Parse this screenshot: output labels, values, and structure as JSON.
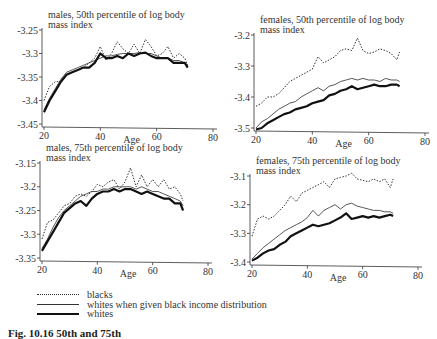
{
  "legend": [
    {
      "label": "blacks",
      "style": "dotted"
    },
    {
      "label": "whites when given black income distribution",
      "style": "thin"
    },
    {
      "label": "whites",
      "style": "thick"
    }
  ],
  "caption": "Fig. 10.16   50th and 75th",
  "chart_data": [
    {
      "type": "line",
      "title": "males, 50th percentile of log body mass index",
      "xlabel": "Age",
      "ylabel": "",
      "xlim": [
        20,
        80
      ],
      "ylim": [
        -3.45,
        -3.25
      ],
      "xticks": [
        20,
        40,
        60,
        80
      ],
      "yticks": [
        -3.25,
        -3.3,
        -3.35,
        -3.4,
        -3.45
      ],
      "ytick_labels": [
        "-3.25",
        "-3.3",
        "-3.35",
        "-3.4",
        "-3.45"
      ],
      "x": [
        20,
        22,
        24,
        26,
        28,
        30,
        32,
        34,
        36,
        38,
        40,
        42,
        44,
        46,
        48,
        50,
        52,
        54,
        56,
        58,
        60,
        62,
        64,
        66,
        68,
        70,
        71
      ],
      "series": [
        {
          "name": "blacks",
          "values": [
            -3.4,
            -3.37,
            -3.36,
            -3.36,
            -3.345,
            -3.34,
            -3.335,
            -3.33,
            -3.32,
            -3.31,
            -3.285,
            -3.315,
            -3.3,
            -3.275,
            -3.29,
            -3.3,
            -3.28,
            -3.3,
            -3.27,
            -3.285,
            -3.305,
            -3.3,
            -3.285,
            -3.31,
            -3.3,
            -3.31,
            -3.325
          ]
        },
        {
          "name": "whites when given black income distribution",
          "values": [
            -3.42,
            -3.395,
            -3.375,
            -3.355,
            -3.34,
            -3.335,
            -3.33,
            -3.325,
            -3.32,
            -3.315,
            -3.31,
            -3.305,
            -3.305,
            -3.302,
            -3.3,
            -3.3,
            -3.3,
            -3.298,
            -3.3,
            -3.3,
            -3.305,
            -3.31,
            -3.31,
            -3.315,
            -3.315,
            -3.32,
            -3.325
          ]
        },
        {
          "name": "whites",
          "values": [
            -3.425,
            -3.4,
            -3.38,
            -3.36,
            -3.345,
            -3.34,
            -3.335,
            -3.33,
            -3.33,
            -3.32,
            -3.3,
            -3.31,
            -3.31,
            -3.305,
            -3.31,
            -3.3,
            -3.305,
            -3.3,
            -3.298,
            -3.305,
            -3.31,
            -3.31,
            -3.31,
            -3.32,
            -3.32,
            -3.32,
            -3.33
          ]
        }
      ]
    },
    {
      "type": "line",
      "title": "females, 50th percentile of log body mass index",
      "xlabel": "Age",
      "ylabel": "",
      "xlim": [
        20,
        80
      ],
      "ylim": [
        -3.5,
        -3.2
      ],
      "xticks": [
        20,
        40,
        60,
        80
      ],
      "yticks": [
        -3.2,
        -3.3,
        -3.4,
        -3.5
      ],
      "ytick_labels": [
        "-3.2",
        "-3.3",
        "-3.4",
        "-3.5"
      ],
      "x": [
        20,
        22,
        24,
        26,
        28,
        30,
        32,
        34,
        36,
        38,
        40,
        42,
        44,
        46,
        48,
        50,
        52,
        54,
        56,
        58,
        60,
        62,
        64,
        66,
        68,
        70,
        71
      ],
      "series": [
        {
          "name": "blacks",
          "values": [
            -3.43,
            -3.42,
            -3.4,
            -3.4,
            -3.39,
            -3.37,
            -3.35,
            -3.34,
            -3.33,
            -3.32,
            -3.31,
            -3.27,
            -3.29,
            -3.28,
            -3.27,
            -3.25,
            -3.245,
            -3.25,
            -3.21,
            -3.25,
            -3.26,
            -3.255,
            -3.245,
            -3.25,
            -3.26,
            -3.28,
            -3.255
          ]
        },
        {
          "name": "whites when given black income distribution",
          "values": [
            -3.5,
            -3.48,
            -3.47,
            -3.455,
            -3.44,
            -3.43,
            -3.42,
            -3.415,
            -3.4,
            -3.39,
            -3.38,
            -3.37,
            -3.38,
            -3.365,
            -3.36,
            -3.35,
            -3.345,
            -3.34,
            -3.345,
            -3.34,
            -3.345,
            -3.345,
            -3.35,
            -3.34,
            -3.345,
            -3.345,
            -3.35
          ]
        },
        {
          "name": "whites",
          "values": [
            -3.505,
            -3.5,
            -3.485,
            -3.475,
            -3.465,
            -3.455,
            -3.45,
            -3.44,
            -3.435,
            -3.43,
            -3.42,
            -3.415,
            -3.41,
            -3.395,
            -3.39,
            -3.38,
            -3.375,
            -3.365,
            -3.375,
            -3.37,
            -3.365,
            -3.36,
            -3.365,
            -3.365,
            -3.36,
            -3.36,
            -3.365
          ]
        }
      ]
    },
    {
      "type": "line",
      "title": "males, 75th percentile of log body mass index",
      "xlabel": "Age",
      "ylabel": "",
      "xlim": [
        20,
        80
      ],
      "ylim": [
        -3.35,
        -3.15
      ],
      "xticks": [
        20,
        40,
        60,
        80
      ],
      "yticks": [
        -3.15,
        -3.2,
        -3.25,
        -3.3,
        -3.35
      ],
      "ytick_labels": [
        "-3.15",
        "-3.2",
        "-3.25",
        "-3.3",
        "-3.35"
      ],
      "x": [
        20,
        22,
        24,
        26,
        28,
        30,
        32,
        34,
        36,
        38,
        40,
        42,
        44,
        46,
        48,
        50,
        52,
        54,
        56,
        58,
        60,
        62,
        64,
        66,
        68,
        70,
        71
      ],
      "series": [
        {
          "name": "blacks",
          "values": [
            -3.31,
            -3.275,
            -3.27,
            -3.255,
            -3.24,
            -3.235,
            -3.22,
            -3.215,
            -3.22,
            -3.21,
            -3.195,
            -3.2,
            -3.19,
            -3.185,
            -3.205,
            -3.19,
            -3.16,
            -3.2,
            -3.175,
            -3.2,
            -3.185,
            -3.2,
            -3.185,
            -3.205,
            -3.2,
            -3.215,
            -3.23
          ]
        },
        {
          "name": "whites when given black income distribution",
          "values": [
            -3.33,
            -3.31,
            -3.285,
            -3.265,
            -3.25,
            -3.24,
            -3.23,
            -3.22,
            -3.215,
            -3.21,
            -3.21,
            -3.205,
            -3.205,
            -3.2,
            -3.2,
            -3.2,
            -3.2,
            -3.205,
            -3.2,
            -3.205,
            -3.21,
            -3.21,
            -3.215,
            -3.22,
            -3.225,
            -3.23,
            -3.24
          ]
        },
        {
          "name": "whites",
          "values": [
            -3.335,
            -3.315,
            -3.295,
            -3.275,
            -3.255,
            -3.245,
            -3.235,
            -3.23,
            -3.24,
            -3.225,
            -3.215,
            -3.21,
            -3.21,
            -3.205,
            -3.21,
            -3.205,
            -3.205,
            -3.21,
            -3.215,
            -3.21,
            -3.215,
            -3.22,
            -3.225,
            -3.225,
            -3.235,
            -3.235,
            -3.25
          ]
        }
      ]
    },
    {
      "type": "line",
      "title": "females, 75th percentile of log body mass index",
      "xlabel": "Age",
      "ylabel": "",
      "xlim": [
        20,
        80
      ],
      "ylim": [
        -3.4,
        -3.1
      ],
      "xticks": [
        20,
        40,
        60,
        80
      ],
      "yticks": [
        -3.1,
        -3.2,
        -3.3,
        -3.4
      ],
      "ytick_labels": [
        "-3.1",
        "-3.2",
        "-3.3",
        "-3.4"
      ],
      "x": [
        20,
        22,
        24,
        26,
        28,
        30,
        32,
        34,
        36,
        38,
        40,
        42,
        44,
        46,
        48,
        50,
        52,
        54,
        56,
        58,
        60,
        62,
        64,
        66,
        68,
        70,
        71
      ],
      "series": [
        {
          "name": "blacks",
          "values": [
            -3.31,
            -3.25,
            -3.24,
            -3.25,
            -3.24,
            -3.22,
            -3.2,
            -3.17,
            -3.19,
            -3.16,
            -3.15,
            -3.14,
            -3.13,
            -3.12,
            -3.14,
            -3.11,
            -3.105,
            -3.1,
            -3.09,
            -3.11,
            -3.115,
            -3.12,
            -3.11,
            -3.12,
            -3.11,
            -3.14,
            -3.11
          ]
        },
        {
          "name": "whites when given black income distribution",
          "values": [
            -3.39,
            -3.37,
            -3.35,
            -3.335,
            -3.32,
            -3.305,
            -3.29,
            -3.28,
            -3.27,
            -3.26,
            -3.245,
            -3.22,
            -3.24,
            -3.22,
            -3.21,
            -3.2,
            -3.215,
            -3.2,
            -3.195,
            -3.205,
            -3.21,
            -3.215,
            -3.22,
            -3.22,
            -3.225,
            -3.225,
            -3.23
          ]
        },
        {
          "name": "whites",
          "values": [
            -3.395,
            -3.385,
            -3.37,
            -3.36,
            -3.355,
            -3.34,
            -3.33,
            -3.31,
            -3.3,
            -3.29,
            -3.28,
            -3.27,
            -3.275,
            -3.27,
            -3.265,
            -3.255,
            -3.245,
            -3.23,
            -3.25,
            -3.245,
            -3.24,
            -3.245,
            -3.24,
            -3.245,
            -3.24,
            -3.235,
            -3.24
          ]
        }
      ]
    }
  ]
}
